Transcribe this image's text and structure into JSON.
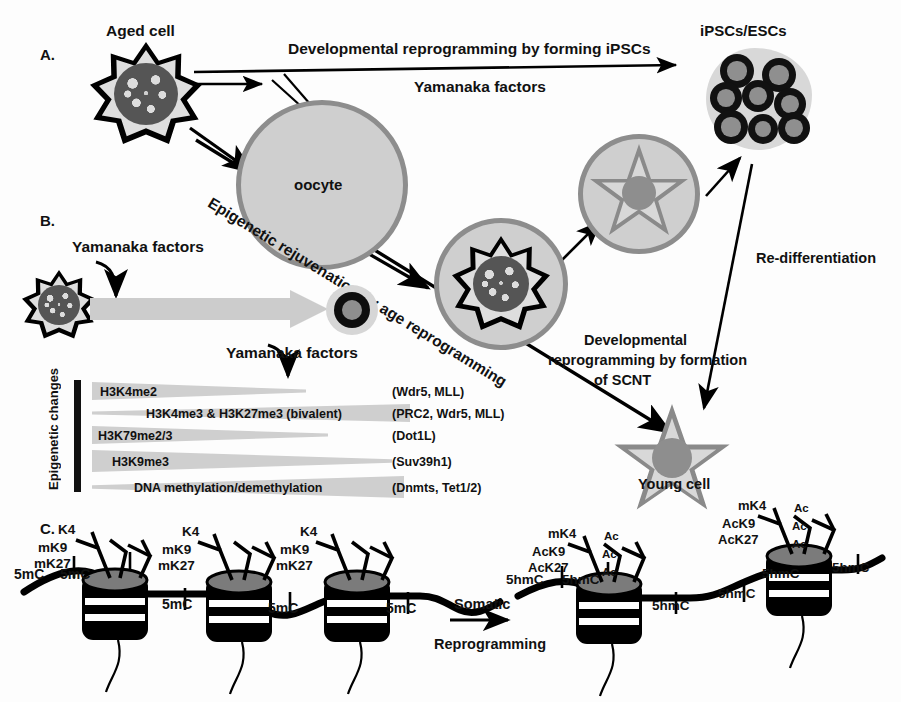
{
  "panels": {
    "a": "A.",
    "b": "B.",
    "c": "C."
  },
  "labels": {
    "aged_cell": "Aged cell",
    "oocyte": "oocyte",
    "ipsc_escs": "iPSCs/ESCs",
    "young_cell": "Young cell"
  },
  "arrows": {
    "dev_reprogramming_ipsc": "Developmental reprogramming by forming iPSCs",
    "yamanaka_factors_top": "Yamanaka factors",
    "epigenetic_rejuvenation": "Epigenetic rejuvenation by age reprogramming",
    "dev_reprogramming_scnt_line1": "Developmental",
    "dev_reprogramming_scnt_line2": "reprogramming by formation",
    "dev_reprogramming_scnt_line3": "of  SCNT",
    "re_differentiation": "Re-differentiation",
    "yamanaka_factors_b_top": "Yamanaka factors",
    "yamanaka_factors_b_bottom": "Yamanaka factors",
    "somatic_line1": "Somatic",
    "somatic_line2": "Reprogramming"
  },
  "epigenetic": {
    "axis_label": "Epigenetic changes",
    "rows": [
      {
        "mark": "H3K4me2",
        "enzymes": "(Wdr5, MLL)",
        "direction": "decrease"
      },
      {
        "mark": "H3K4me3 & H3K27me3 (bivalent)",
        "enzymes": "(PRC2, Wdr5, MLL)",
        "direction": "increase"
      },
      {
        "mark": "H3K79me2/3",
        "enzymes": "(Dot1L)",
        "direction": "decrease"
      },
      {
        "mark": "H3K9me3",
        "enzymes": "(Suv39h1)",
        "direction": "decrease"
      },
      {
        "mark": "DNA methylation/demethylation",
        "enzymes": "(Dnmts, Tet1/2)",
        "direction": "increase"
      }
    ]
  },
  "chromatin": {
    "left": {
      "dna_marks": [
        "5mC",
        "5mC",
        "5mC",
        "5mC",
        "5mC"
      ],
      "nucleosomes": [
        {
          "tail_marks": [
            "K4",
            "mK9",
            "mK27"
          ]
        },
        {
          "tail_marks": [
            "K4",
            "mK9",
            "mK27"
          ]
        },
        {
          "tail_marks": [
            "K4",
            "mK9",
            "mK27"
          ]
        }
      ]
    },
    "right": {
      "dna_marks": [
        "5hmC",
        "5hmC",
        "5hmC",
        "5hmC",
        "5hmC",
        "5hmC"
      ],
      "nucleosomes": [
        {
          "tail_marks": [
            "mK4",
            "AcK9",
            "AcK27"
          ],
          "ac_marks": [
            "Ac",
            "Ac",
            "Ac"
          ]
        },
        {
          "tail_marks": [
            "mK4",
            "AcK9",
            "AcK27"
          ],
          "ac_marks": [
            "Ac",
            "Ac",
            "Ac"
          ]
        }
      ]
    }
  },
  "colors": {
    "cell_fill": "#d4d4d4",
    "nucleus": "#555555",
    "outline": "#000000",
    "oocyte_border": "#8d8d8d",
    "wedge": "#cfcfcf",
    "gray_arrow": "#cccccc",
    "star_gray": "#8a8a8a"
  }
}
